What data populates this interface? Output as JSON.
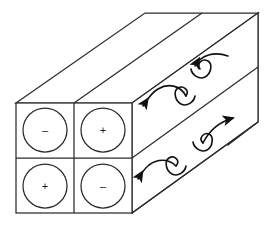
{
  "figure": {
    "stroke_color": "#2b2b2b",
    "fill_color": "#ffffff",
    "arrow_color": "#111111"
  },
  "front_face": {
    "label": "duct cross-section",
    "rows": [
      {
        "cells": [
          {
            "sign": "–",
            "name": "cell-top-left"
          },
          {
            "sign": "+",
            "name": "cell-top-right"
          }
        ]
      },
      {
        "cells": [
          {
            "sign": "+",
            "name": "cell-bottom-left"
          },
          {
            "sign": "–",
            "name": "cell-bottom-right"
          }
        ]
      }
    ]
  },
  "vortices": [
    {
      "name": "vortex-upper-left",
      "direction": "left",
      "sense": "counter-clockwise"
    },
    {
      "name": "vortex-upper-right",
      "direction": "left",
      "sense": "clockwise"
    },
    {
      "name": "vortex-lower-left",
      "direction": "left",
      "sense": "counter-clockwise"
    },
    {
      "name": "vortex-lower-right",
      "direction": "right",
      "sense": "clockwise"
    }
  ]
}
